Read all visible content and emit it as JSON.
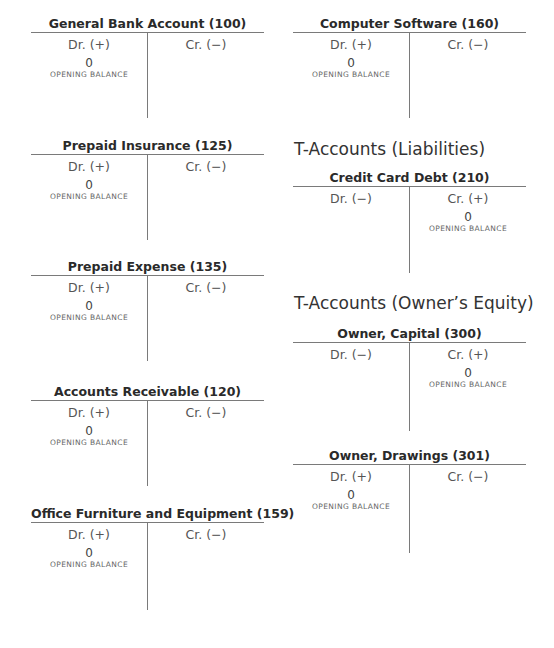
{
  "sections": {
    "liabilities_heading": "T-Accounts (Liabilities)",
    "equity_heading": "T-Accounts (Owner’s Equity)"
  },
  "accounts": [
    {
      "name": "General Bank Account (100)",
      "dr_label": "Dr. (+)",
      "cr_label": "Cr. (−)",
      "balance_side": "dr",
      "amount": "0",
      "entry_label": "OPENING BALANCE"
    },
    {
      "name": "Prepaid Insurance (125)",
      "dr_label": "Dr. (+)",
      "cr_label": "Cr. (−)",
      "balance_side": "dr",
      "amount": "0",
      "entry_label": "OPENING BALANCE"
    },
    {
      "name": "Prepaid Expense (135)",
      "dr_label": "Dr. (+)",
      "cr_label": "Cr. (−)",
      "balance_side": "dr",
      "amount": "0",
      "entry_label": "OPENING BALANCE"
    },
    {
      "name": "Accounts Receivable (120)",
      "dr_label": "Dr. (+)",
      "cr_label": "Cr. (−)",
      "balance_side": "dr",
      "amount": "0",
      "entry_label": "OPENING BALANCE"
    },
    {
      "name": "Office Furniture and Equipment (159)",
      "dr_label": "Dr. (+)",
      "cr_label": "Cr. (−)",
      "balance_side": "dr",
      "amount": "0",
      "entry_label": "OPENING BALANCE"
    },
    {
      "name": "Computer Software (160)",
      "dr_label": "Dr. (+)",
      "cr_label": "Cr. (−)",
      "balance_side": "dr",
      "amount": "0",
      "entry_label": "OPENING BALANCE"
    },
    {
      "name": "Credit Card Debt (210)",
      "dr_label": "Dr. (−)",
      "cr_label": "Cr. (+)",
      "balance_side": "cr",
      "amount": "0",
      "entry_label": "OPENING BALANCE"
    },
    {
      "name": "Owner, Capital (300)",
      "dr_label": "Dr. (−)",
      "cr_label": "Cr. (+)",
      "balance_side": "cr",
      "amount": "0",
      "entry_label": "OPENING BALANCE"
    },
    {
      "name": "Owner, Drawings (301)",
      "dr_label": "Dr. (+)",
      "cr_label": "Cr. (−)",
      "balance_side": "dr",
      "amount": "0",
      "entry_label": "OPENING BALANCE"
    }
  ]
}
